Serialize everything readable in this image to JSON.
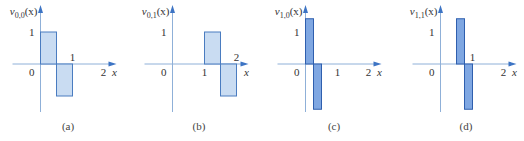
{
  "chart_data": [
    {
      "type": "bar",
      "title": "v_{0,0}(x)",
      "func_label": "v",
      "sub": "0,0",
      "arg": "(x)",
      "caption": "(a)",
      "xlabel": "x",
      "origin_label": "0",
      "x_ticks": [
        {
          "value": 1,
          "label": "1",
          "pos": "above"
        },
        {
          "value": 2,
          "label": "2",
          "pos": "below"
        }
      ],
      "y_ticks": [
        {
          "value": 1,
          "label": "1"
        }
      ],
      "segments": [
        {
          "x0": 0,
          "x1": 0.5,
          "y": 1
        },
        {
          "x0": 0.5,
          "x1": 1,
          "y": -1
        }
      ],
      "style": "light"
    },
    {
      "type": "bar",
      "title": "v_{0,1}(x)",
      "func_label": "v",
      "sub": "0,1",
      "arg": "(x)",
      "caption": "(b)",
      "xlabel": "x",
      "origin_label": "0",
      "x_ticks": [
        {
          "value": 1,
          "label": "1",
          "pos": "below"
        },
        {
          "value": 2,
          "label": "2",
          "pos": "above"
        }
      ],
      "y_ticks": [
        {
          "value": 1,
          "label": "1"
        }
      ],
      "segments": [
        {
          "x0": 1,
          "x1": 1.5,
          "y": 1
        },
        {
          "x0": 1.5,
          "x1": 2,
          "y": -1
        }
      ],
      "style": "light"
    },
    {
      "type": "bar",
      "title": "v_{1,0}(x)",
      "func_label": "v",
      "sub": "1,0",
      "arg": "(x)",
      "caption": "(c)",
      "xlabel": "x",
      "origin_label": "0",
      "x_ticks": [
        {
          "value": 1,
          "label": "1",
          "pos": "below"
        },
        {
          "value": 2,
          "label": "2",
          "pos": "below"
        }
      ],
      "y_ticks": [
        {
          "value": 1,
          "label": "1"
        }
      ],
      "segments": [
        {
          "x0": 0,
          "x1": 0.25,
          "y": 1.414
        },
        {
          "x0": 0.25,
          "x1": 0.5,
          "y": -1.414
        }
      ],
      "style": "dark"
    },
    {
      "type": "bar",
      "title": "v_{1,1}(x)",
      "func_label": "v",
      "sub": "1,1",
      "arg": "(x)",
      "caption": "(d)",
      "xlabel": "x",
      "origin_label": "0",
      "x_ticks": [
        {
          "value": 1,
          "label": "1",
          "pos": "above"
        },
        {
          "value": 2,
          "label": "2",
          "pos": "below"
        }
      ],
      "y_ticks": [
        {
          "value": 1,
          "label": "1"
        }
      ],
      "segments": [
        {
          "x0": 0.5,
          "x1": 0.75,
          "y": 1.414
        },
        {
          "x0": 0.75,
          "x1": 1,
          "y": -1.414
        }
      ],
      "style": "dark"
    }
  ],
  "colors": {
    "light_fill": "#c9dcf2",
    "light_stroke": "#4a7cc0",
    "dark_fill": "#7fa7e2",
    "dark_stroke": "#2f5fae",
    "axis": "#8fb0d8",
    "arrow": "#3d74c4"
  }
}
